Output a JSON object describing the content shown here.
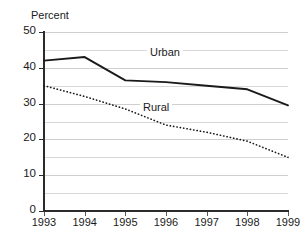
{
  "chart_data": {
    "type": "line",
    "title": "Medicare Enrollment 1993-1999",
    "subtitle": "",
    "ylabel": "Percent",
    "xlabel": "",
    "categories": [
      "1993",
      "1994",
      "1995",
      "1996",
      "1997",
      "1998",
      "1999"
    ],
    "x": [
      1993,
      1994,
      1995,
      1996,
      1997,
      1998,
      1999
    ],
    "ylim": [
      0,
      50
    ],
    "yticks": [
      0,
      10,
      20,
      30,
      40,
      50
    ],
    "ytick_labels": [
      "0",
      "10",
      "20",
      "30",
      "40",
      "50"
    ],
    "grid": true,
    "grid_interval": 5,
    "legend": "inline-labels",
    "series": [
      {
        "name": "Urban",
        "style": "solid",
        "color": "#1a1a1a",
        "values": [
          42,
          43,
          36.5,
          36,
          35,
          34,
          29.5
        ]
      },
      {
        "name": "Rural",
        "style": "dotted",
        "color": "#1a1a1a",
        "values": [
          35,
          32,
          28.5,
          24,
          22,
          19.5,
          15
        ]
      }
    ],
    "annotations": [
      {
        "text": "Urban",
        "series": "Urban"
      },
      {
        "text": "Rural",
        "series": "Rural"
      }
    ]
  }
}
